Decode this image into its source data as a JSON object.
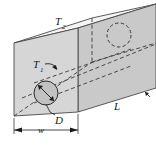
{
  "figure": {
    "labels": {
      "t1_base": "T",
      "t1_sub": "1",
      "t2_base": "T",
      "t2_sub": "2",
      "diameter": "D",
      "length": "L",
      "width": "w"
    },
    "colors": {
      "front_face": "#d4d4d4",
      "top_face": "#f2f2f2",
      "side_face": "#c9c9c9",
      "outline": "#4a4a4a",
      "hidden_line": "#3a3a3a",
      "label_text": "#1a1a1a",
      "pipe_fill": "#c0c0c0",
      "background": "#ffffff"
    },
    "geometry": {
      "front_face_points": "14,43 78,28 78,112 14,116",
      "top_face_points": "14,43 78,28 156,4 92,18",
      "side_face_points": "78,28 156,4 156,88 78,112",
      "pipe_near_center_x": 46,
      "pipe_near_center_y": 93,
      "pipe_near_radius": 12,
      "pipe_far_center_x": 119,
      "pipe_far_center_y": 35,
      "pipe_far_radius": 12,
      "width_dim_y": 130
    }
  }
}
